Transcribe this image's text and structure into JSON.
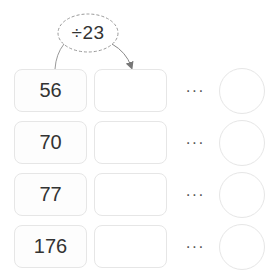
{
  "operation": {
    "label": "÷23",
    "operator": "÷",
    "operand": "23"
  },
  "rows": [
    {
      "input": "56",
      "output": "",
      "ellipsis": "···",
      "remainder": ""
    },
    {
      "input": "70",
      "output": "",
      "ellipsis": "···",
      "remainder": ""
    },
    {
      "input": "77",
      "output": "",
      "ellipsis": "···",
      "remainder": ""
    },
    {
      "input": "176",
      "output": "",
      "ellipsis": "···",
      "remainder": ""
    }
  ],
  "colors": {
    "box_border": "#e6e6e6",
    "text": "#333333",
    "connector": "#888888"
  }
}
